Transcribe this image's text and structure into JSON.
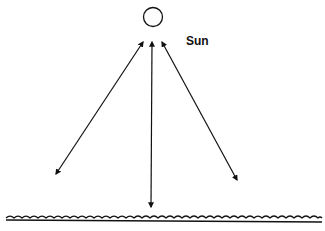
{
  "diagram": {
    "sun_label": "Sun",
    "colors": {
      "stroke": "#111111",
      "background": "#ffffff"
    }
  }
}
